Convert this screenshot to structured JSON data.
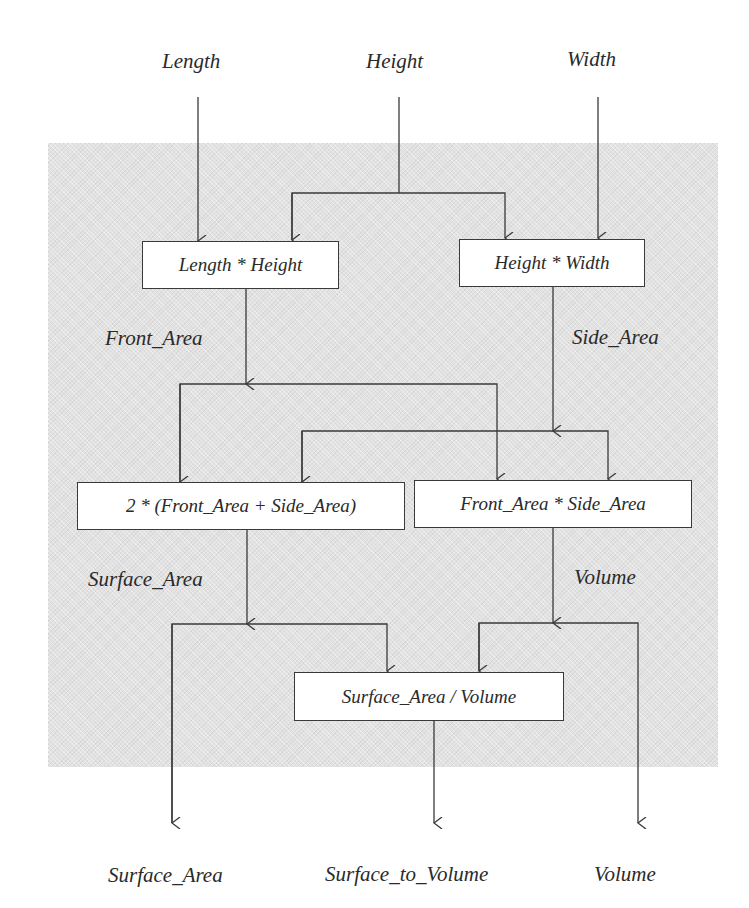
{
  "inputs": {
    "length": "Length",
    "height": "Height",
    "width": "Width"
  },
  "boxes": {
    "front_calc": "Length * Height",
    "side_calc": "Height * Width",
    "surface_calc": "2 * (Front_Area + Side_Area)",
    "volume_calc": "Front_Area * Side_Area",
    "ratio_calc": "Surface_Area / Volume"
  },
  "flows": {
    "front_area": "Front_Area",
    "side_area": "Side_Area",
    "surface_area": "Surface_Area",
    "volume": "Volume"
  },
  "outputs": {
    "surface_area": "Surface_Area",
    "surface_to_volume": "Surface_to_Volume",
    "volume": "Volume"
  },
  "colors": {
    "panel": "#e2e2e2",
    "line": "#3a3a3a",
    "box_fill": "#ffffff",
    "text": "#2a2a2a"
  }
}
